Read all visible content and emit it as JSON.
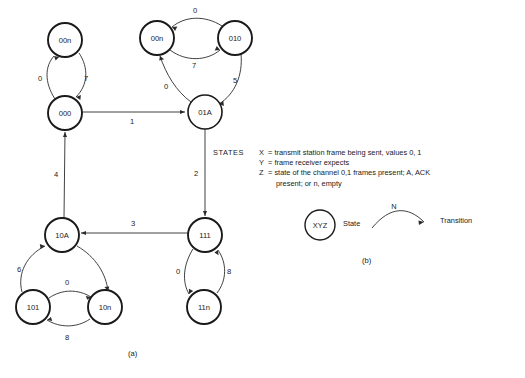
{
  "figure": {
    "caption_a": "(a)",
    "caption_b": "(b)",
    "states": [
      {
        "id": "n00n_left",
        "label": "00n",
        "cx": 65,
        "cy": 40,
        "r": 17
      },
      {
        "id": "n000",
        "label": "000",
        "cx": 65,
        "cy": 113,
        "r": 17
      },
      {
        "id": "n00n_right",
        "label": "00n",
        "cx": 157,
        "cy": 38,
        "r": 17
      },
      {
        "id": "n010",
        "label": "010",
        "cx": 235,
        "cy": 38,
        "r": 17
      },
      {
        "id": "n01A",
        "label": "01A",
        "cx": 205,
        "cy": 112,
        "r": 17
      },
      {
        "id": "n10A",
        "label": "10A",
        "cx": 62,
        "cy": 235,
        "r": 17
      },
      {
        "id": "n101",
        "label": "101",
        "cx": 33,
        "cy": 307,
        "r": 17
      },
      {
        "id": "n10n",
        "label": "10n",
        "cx": 105,
        "cy": 307,
        "r": 17
      },
      {
        "id": "n111",
        "label": "111",
        "cx": 205,
        "cy": 235,
        "r": 17
      },
      {
        "id": "n11n",
        "label": "11n",
        "cx": 204,
        "cy": 307,
        "r": 17
      }
    ],
    "transitions": [
      {
        "from": "n000",
        "to": "n00n_left",
        "label": "0"
      },
      {
        "from": "n00n_left",
        "to": "n000",
        "label": "7"
      },
      {
        "from": "n010",
        "to": "n00n_right",
        "label": "0"
      },
      {
        "from": "n00n_right",
        "to": "n010",
        "label": "7"
      },
      {
        "from": "n010",
        "to": "n01A",
        "label": "5"
      },
      {
        "from": "n01A",
        "to": "n00n_right",
        "label": "0"
      },
      {
        "from": "n000",
        "to": "n01A",
        "label": "1"
      },
      {
        "from": "n01A",
        "to": "n111",
        "label": "2"
      },
      {
        "from": "n111",
        "to": "n10A",
        "label": "3"
      },
      {
        "from": "n10A",
        "to": "n000",
        "label": "4"
      },
      {
        "from": "n101",
        "to": "n10A",
        "label": "6"
      },
      {
        "from": "n10A",
        "to": "n10n",
        "label": ""
      },
      {
        "from": "n101",
        "to": "n10n",
        "label": "0"
      },
      {
        "from": "n10n",
        "to": "n101",
        "label": "8"
      },
      {
        "from": "n111",
        "to": "n11n",
        "label": "0"
      },
      {
        "from": "n11n",
        "to": "n111",
        "label": "8"
      }
    ],
    "edge_labels": {
      "l_0_upper_left": "0",
      "l_7_upper_left": "7",
      "l_0_upper_right": "0",
      "l_7_upper_right": "7",
      "l_5": "5",
      "l_0_01A": "0",
      "l_1": "1",
      "l_2": "2",
      "l_3": "3",
      "l_4": "4",
      "l_6": "6",
      "l_0_lower_left": "0",
      "l_8_lower_left": "8",
      "l_0_lower_right": "0",
      "l_8_lower_right": "8"
    }
  },
  "legend": {
    "title": "STATES",
    "definitions": [
      {
        "symbol": "X",
        "equals": "=",
        "text": "transmit station frame being sent, values 0, 1"
      },
      {
        "symbol": "Y",
        "equals": "=",
        "text": "frame receiver expects"
      },
      {
        "symbol": "Z",
        "equals": "=",
        "text": "state of the channel 0,1 frames present; A, ACK"
      }
    ],
    "continuation": "present; or n, empty"
  },
  "key": {
    "node_label": "XYZ",
    "state_label": "State",
    "transition_label": "Transition",
    "arc_label": "N"
  }
}
